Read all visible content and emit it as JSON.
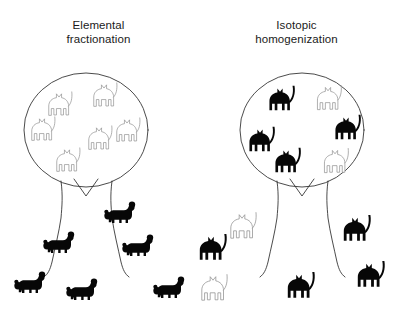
{
  "figure": {
    "name": "elemental-fractionation-vs-isotopic-homogenization-cat-tree-diagram",
    "width": 395,
    "height": 322,
    "background_color": "#ffffff",
    "line_color": "#2b2b2b",
    "filled_animal_color": "#070707",
    "outline_animal_color": "#8c8c8c"
  },
  "panels": [
    {
      "id": "left",
      "title": "Elemental\nfractionation",
      "title_line1": "Elemental",
      "title_line2": "fractionation",
      "tree": {
        "canopy_cx": 86,
        "canopy_cy": 130,
        "canopy_rx": 62,
        "canopy_ry": 57
      },
      "inside_animals": {
        "species": "cat",
        "style": "outline",
        "count": 6,
        "positions": [
          {
            "x": 59,
            "y": 106,
            "s": 1.0,
            "flip": false
          },
          {
            "x": 104,
            "y": 97,
            "s": 1.0,
            "flip": false
          },
          {
            "x": 42,
            "y": 131,
            "s": 1.0,
            "flip": false
          },
          {
            "x": 127,
            "y": 132,
            "s": 1.0,
            "flip": false
          },
          {
            "x": 99,
            "y": 140,
            "s": 1.0,
            "flip": false
          },
          {
            "x": 67,
            "y": 162,
            "s": 1.0,
            "flip": false
          }
        ]
      },
      "outside_animals": {
        "species": "poodle",
        "style": "filled",
        "count": 6,
        "positions": [
          {
            "x": 120,
            "y": 215,
            "s": 1.0,
            "flip": false
          },
          {
            "x": 59,
            "y": 245,
            "s": 1.0,
            "flip": false
          },
          {
            "x": 138,
            "y": 248,
            "s": 1.0,
            "flip": false
          },
          {
            "x": 30,
            "y": 285,
            "s": 1.0,
            "flip": false
          },
          {
            "x": 82,
            "y": 292,
            "s": 1.0,
            "flip": false
          },
          {
            "x": 169,
            "y": 290,
            "s": 1.0,
            "flip": false
          }
        ]
      }
    },
    {
      "id": "right",
      "title": "Isotopic\nhomogenization",
      "title_line1": "Isotopic",
      "title_line2": "homogenization",
      "tree": {
        "canopy_cx": 104,
        "canopy_cy": 130,
        "canopy_rx": 62,
        "canopy_ry": 57
      },
      "inside_animals": {
        "species": "cat",
        "style": "mixed",
        "count": 6,
        "positions": [
          {
            "x": 82,
            "y": 101,
            "s": 1.0,
            "style": "filled"
          },
          {
            "x": 130,
            "y": 100,
            "s": 1.0,
            "style": "outline"
          },
          {
            "x": 62,
            "y": 142,
            "s": 1.0,
            "style": "filled"
          },
          {
            "x": 148,
            "y": 130,
            "s": 1.0,
            "style": "filled"
          },
          {
            "x": 88,
            "y": 163,
            "s": 1.0,
            "style": "filled"
          },
          {
            "x": 137,
            "y": 163,
            "s": 1.0,
            "style": "outline"
          }
        ]
      },
      "outside_animals": {
        "species": "cat",
        "style": "mixed",
        "count": 6,
        "positions": [
          {
            "x": 44,
            "y": 228,
            "s": 1.0,
            "style": "outline"
          },
          {
            "x": 157,
            "y": 231,
            "s": 1.0,
            "style": "filled"
          },
          {
            "x": 13,
            "y": 250,
            "s": 1.0,
            "style": "filled"
          },
          {
            "x": 171,
            "y": 277,
            "s": 1.0,
            "style": "filled"
          },
          {
            "x": 15,
            "y": 290,
            "s": 1.0,
            "style": "outline"
          },
          {
            "x": 101,
            "y": 288,
            "s": 1.0,
            "style": "filled"
          }
        ]
      }
    }
  ],
  "legend_note": {
    "left_meaning": "inside canopy: outlined cats; outside canopy: filled poodles",
    "right_meaning": "inside canopy: mostly filled cats with two outlined; outside canopy: filled and outlined cats"
  }
}
